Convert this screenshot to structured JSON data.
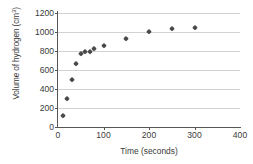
{
  "chart_data": {
    "type": "scatter",
    "title": "",
    "xlabel": "Time (seconds)",
    "ylabel": "Volume of hydrogen (cm³)",
    "ylabel_text": "Volume of hydrogen (cm",
    "ylabel_sup": "3",
    "ylabel_close": ")",
    "xlim": [
      0,
      400
    ],
    "ylim": [
      0,
      1200
    ],
    "xticks": [
      0,
      100,
      200,
      300,
      400
    ],
    "yticks": [
      0,
      200,
      400,
      600,
      800,
      1000,
      1200
    ],
    "grid": "horizontal",
    "legend": "none",
    "marker": "diamond",
    "marker_color": "#4a4a4a",
    "x": [
      10,
      20,
      30,
      40,
      50,
      60,
      70,
      80,
      100,
      150,
      200,
      250,
      300
    ],
    "y": [
      120,
      295,
      490,
      660,
      770,
      785,
      790,
      820,
      855,
      925,
      995,
      1035,
      1045
    ],
    "points": [
      {
        "x": 10,
        "y": 120
      },
      {
        "x": 20,
        "y": 295
      },
      {
        "x": 30,
        "y": 490
      },
      {
        "x": 40,
        "y": 660
      },
      {
        "x": 50,
        "y": 770
      },
      {
        "x": 60,
        "y": 785
      },
      {
        "x": 70,
        "y": 790
      },
      {
        "x": 80,
        "y": 820
      },
      {
        "x": 100,
        "y": 855
      },
      {
        "x": 150,
        "y": 925
      },
      {
        "x": 200,
        "y": 995
      },
      {
        "x": 250,
        "y": 1035
      },
      {
        "x": 300,
        "y": 1045
      }
    ]
  },
  "axis": {
    "y_tick_labels": [
      "1200",
      "1000",
      "800",
      "600",
      "400",
      "200",
      "0"
    ],
    "x_tick_labels": [
      "0",
      "100",
      "200",
      "300",
      "400"
    ]
  },
  "colors": {
    "grid": "#d2d2d2",
    "axis": "#555555",
    "text": "#3a3a3a",
    "marker": "#4a4a4a",
    "background": "#ffffff"
  }
}
